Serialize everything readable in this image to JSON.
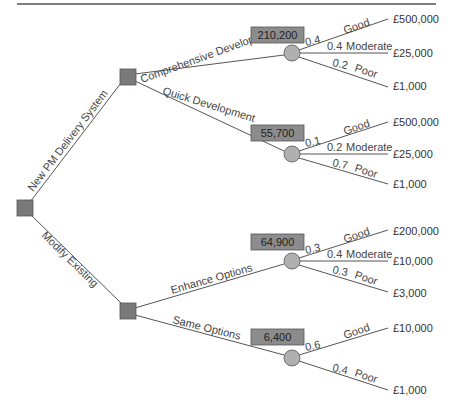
{
  "diagram": {
    "type": "decision-tree",
    "colors": {
      "line": "#555555",
      "decision_fill": "#7a7a7a",
      "chance_fill": "#b0b0b0",
      "ev_box_fill": "#8c8c8c",
      "top_rule": "#555555"
    },
    "root": {
      "branches": [
        {
          "label": "New PM Delivery System"
        },
        {
          "label": "Modify Existing"
        }
      ]
    },
    "decisions": [
      {
        "options": [
          {
            "label": "Comprehensive Development",
            "expected_value": "210,200",
            "outcomes": [
              {
                "prob": "0.4",
                "name": "Good",
                "value": "£500,000"
              },
              {
                "prob": "0.4",
                "name": "Moderate",
                "value": "£25,000"
              },
              {
                "prob": "0.2",
                "name": "Poor",
                "value": "£1,000"
              }
            ]
          },
          {
            "label": "Quick Development",
            "expected_value": "55,700",
            "outcomes": [
              {
                "prob": "0.1",
                "name": "Good",
                "value": "£500,000"
              },
              {
                "prob": "0.2",
                "name": "Moderate",
                "value": "£25,000"
              },
              {
                "prob": "0.7",
                "name": "Poor",
                "value": "£1,000"
              }
            ]
          }
        ]
      },
      {
        "options": [
          {
            "label": "Enhance Options",
            "expected_value": "64,900",
            "outcomes": [
              {
                "prob": "0.3",
                "name": "Good",
                "value": "£200,000"
              },
              {
                "prob": "0.4",
                "name": "Moderate",
                "value": "£10,000"
              },
              {
                "prob": "0.3",
                "name": "Poor",
                "value": "£3,000"
              }
            ]
          },
          {
            "label": "Same Options",
            "expected_value": "6,400",
            "outcomes": [
              {
                "prob": "0.6",
                "name": "Good",
                "value": "£10,000"
              },
              {
                "prob": "0.4",
                "name": "Poor",
                "value": "£1,000"
              }
            ]
          }
        ]
      }
    ]
  }
}
